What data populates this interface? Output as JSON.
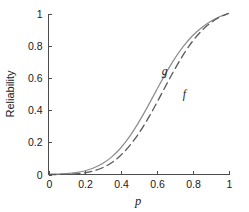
{
  "chart_data": {
    "type": "line",
    "title": "",
    "subtitle": "",
    "xlabel": "p",
    "ylabel": "Reliability",
    "xlim": [
      0,
      1
    ],
    "ylim": [
      0,
      1
    ],
    "xticks": [
      "0",
      "0.2",
      "0.4",
      "0.6",
      "0.8",
      "1"
    ],
    "xtick_values": [
      0,
      0.2,
      0.4,
      0.6,
      0.8,
      1
    ],
    "yticks": [
      "0",
      "0.2",
      "0.4",
      "0.6",
      "0.8",
      "1"
    ],
    "ytick_values": [
      0,
      0.2,
      0.4,
      0.6,
      0.8,
      1
    ],
    "grid": false,
    "legend_position": "inline-annotation",
    "series": [
      {
        "name": "g",
        "label": "g",
        "style": "solid",
        "color": "#8c8c8c",
        "linewidth": 1.2,
        "x": [
          0,
          0.05,
          0.1,
          0.15,
          0.2,
          0.25,
          0.3,
          0.35,
          0.4,
          0.45,
          0.5,
          0.55,
          0.6,
          0.65,
          0.7,
          0.75,
          0.8,
          0.85,
          0.9,
          0.95,
          1.0
        ],
        "values": [
          0.0,
          0.002,
          0.006,
          0.012,
          0.022,
          0.04,
          0.068,
          0.108,
          0.163,
          0.235,
          0.322,
          0.42,
          0.524,
          0.625,
          0.718,
          0.797,
          0.862,
          0.912,
          0.951,
          0.98,
          1.0
        ]
      },
      {
        "name": "f",
        "label": "f",
        "style": "dashed",
        "color": "#595959",
        "linewidth": 1.3,
        "x": [
          0,
          0.05,
          0.1,
          0.15,
          0.2,
          0.25,
          0.3,
          0.35,
          0.4,
          0.45,
          0.5,
          0.55,
          0.6,
          0.65,
          0.7,
          0.75,
          0.8,
          0.85,
          0.9,
          0.95,
          1.0
        ],
        "values": [
          0.0,
          0.0,
          0.001,
          0.004,
          0.01,
          0.022,
          0.042,
          0.073,
          0.118,
          0.178,
          0.253,
          0.342,
          0.442,
          0.548,
          0.651,
          0.746,
          0.827,
          0.892,
          0.941,
          0.977,
          1.0
        ]
      }
    ],
    "annotations": [
      {
        "text": "g",
        "x": 0.645,
        "y": 0.615,
        "series": "g"
      },
      {
        "text": "f",
        "x": 0.755,
        "y": 0.478,
        "series": "f"
      }
    ]
  }
}
